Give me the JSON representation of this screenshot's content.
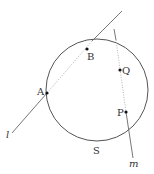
{
  "diagram": {
    "circle": {
      "label": "S",
      "cx": 97,
      "cy": 90,
      "r": 51
    },
    "lines": [
      {
        "label": "l",
        "from": [
          12,
          133
        ],
        "to": [
          122,
          11
        ],
        "dotted_segment": [
          [
            47,
            93
          ],
          [
            92,
            41
          ]
        ]
      },
      {
        "label": "m",
        "from": [
          114,
          29
        ],
        "to": [
          133,
          158
        ],
        "dotted_segment": [
          [
            116,
            40
          ],
          [
            126,
            112
          ]
        ]
      }
    ],
    "points": [
      {
        "label": "A",
        "x": 47,
        "y": 93
      },
      {
        "label": "B",
        "x": 87,
        "y": 49
      },
      {
        "label": "Q",
        "x": 120,
        "y": 70
      },
      {
        "label": "P",
        "x": 126,
        "y": 112
      }
    ],
    "colors": {
      "stroke": "#555555",
      "point": "#111111",
      "dotted": "#aaaaaa"
    }
  },
  "labels": {
    "A": "A",
    "B": "B",
    "Q": "Q",
    "P": "P",
    "S": "S",
    "l": "l",
    "m": "m"
  }
}
